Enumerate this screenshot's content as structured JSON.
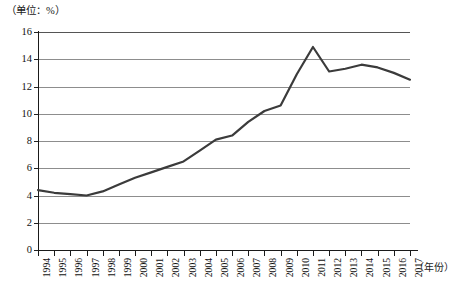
{
  "chart_data": {
    "type": "line",
    "title": "",
    "unit_label": "（单位：%）",
    "xlabel": "（年份）",
    "ylabel": "",
    "grid": true,
    "legend": "none",
    "xlim": [
      1994,
      2017
    ],
    "ylim": [
      0,
      16
    ],
    "ytick_step": 2,
    "yticks": [
      0,
      2,
      4,
      6,
      8,
      10,
      12,
      14,
      16
    ],
    "ytick_labels": [
      "0",
      "2",
      "4",
      "6",
      "8",
      "10",
      "12",
      "14",
      "16"
    ],
    "categories": [
      "1994",
      "1995",
      "1996",
      "1997",
      "1998",
      "1999",
      "2000",
      "2001",
      "2002",
      "2003",
      "2004",
      "2005",
      "2006",
      "2007",
      "2008",
      "2009",
      "2010",
      "2011",
      "2012",
      "2013",
      "2014",
      "2015",
      "2016",
      "2017"
    ],
    "x": [
      1994,
      1995,
      1996,
      1997,
      1998,
      1999,
      2000,
      2001,
      2002,
      2003,
      2004,
      2005,
      2006,
      2007,
      2008,
      2009,
      2010,
      2011,
      2012,
      2013,
      2014,
      2015,
      2016,
      2017
    ],
    "values": [
      4.4,
      4.2,
      4.1,
      4.0,
      4.3,
      4.8,
      5.3,
      5.7,
      6.1,
      6.5,
      7.3,
      8.1,
      8.4,
      9.4,
      10.2,
      10.6,
      12.9,
      14.9,
      13.1,
      13.3,
      13.6,
      13.4,
      13.0,
      12.5
    ],
    "series": [
      {
        "name": "",
        "color": "#3b3b3b",
        "values": [
          4.4,
          4.2,
          4.1,
          4.0,
          4.3,
          4.8,
          5.3,
          5.7,
          6.1,
          6.5,
          7.3,
          8.1,
          8.4,
          9.4,
          10.2,
          10.6,
          12.9,
          14.9,
          13.1,
          13.3,
          13.6,
          13.4,
          13.0,
          12.5
        ]
      }
    ],
    "annotations": []
  },
  "colors": {
    "line": "#3b3b3b",
    "grid": "#8d8d8d",
    "axis": "#1a1a1a",
    "background": "#ffffff"
  }
}
